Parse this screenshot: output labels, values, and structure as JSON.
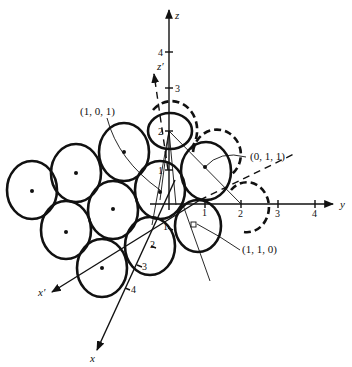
{
  "figure": {
    "axes": {
      "z": {
        "label": "z",
        "ticks": [
          "1",
          "2",
          "3",
          "4"
        ]
      },
      "y": {
        "label": "y",
        "ticks": [
          "1",
          "2",
          "3",
          "4"
        ]
      },
      "x": {
        "label": "x",
        "ticks": [
          "1",
          "2",
          "3",
          "4"
        ]
      },
      "x_prime": {
        "label": "x′"
      },
      "z_prime": {
        "label": "z′"
      }
    },
    "annotations": [
      {
        "id": "p101",
        "text": "(1, 0, 1)"
      },
      {
        "id": "p011",
        "text": "(0, 1, 1)"
      },
      {
        "id": "p110",
        "text": "(1, 1, 0)"
      }
    ],
    "spheres": {
      "solid_count": 11,
      "dashed_count": 3
    }
  }
}
